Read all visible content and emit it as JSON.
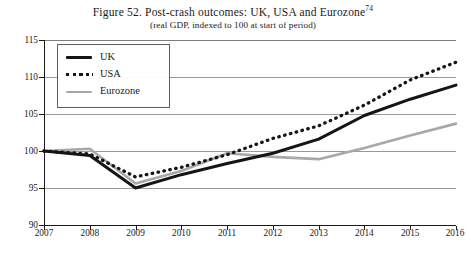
{
  "figure": {
    "title_main": "Figure 52. Post-crash outcomes: UK, USA and Eurozone",
    "title_footnote": "74",
    "subtitle": "(real GDP, indexed to 100 at start of period)"
  },
  "colors": {
    "uk": "#151515",
    "usa": "#151515",
    "eurozone": "#a8a8a8",
    "gridline": "#9a9a9a",
    "axis": "#1a1a1a",
    "background": "#ffffff"
  },
  "legend": {
    "position": "top-left-inside",
    "entries": [
      {
        "label": "UK",
        "style": "solid",
        "color": "#151515"
      },
      {
        "label": "USA",
        "style": "dotted",
        "color": "#151515"
      },
      {
        "label": "Eurozone",
        "style": "solid",
        "color": "#a8a8a8"
      }
    ]
  },
  "axes": {
    "y_ticks": [
      "115",
      "110",
      "105",
      "100",
      "95",
      "90"
    ],
    "x_ticks": [
      "2007",
      "2008",
      "2009",
      "2010",
      "2011",
      "2012",
      "2013",
      "2014",
      "2015",
      "2016"
    ]
  },
  "chart_data": {
    "type": "line",
    "title": "Figure 52. Post-crash outcomes: UK, USA and Eurozone",
    "subtitle": "(real GDP, indexed to 100 at start of period)",
    "xlabel": "",
    "ylabel": "",
    "x": [
      2007,
      2008,
      2009,
      2010,
      2011,
      2012,
      2013,
      2014,
      2015,
      2016
    ],
    "categories": [
      "2007",
      "2008",
      "2009",
      "2010",
      "2011",
      "2012",
      "2013",
      "2014",
      "2015",
      "2016"
    ],
    "xlim": [
      2007,
      2016
    ],
    "ylim": [
      90,
      115
    ],
    "y_tick_values": [
      90,
      95,
      100,
      105,
      110,
      115
    ],
    "grid": true,
    "legend_position": "upper left",
    "series": [
      {
        "name": "UK",
        "style": "solid",
        "color": "#151515",
        "values": [
          100.0,
          99.4,
          95.0,
          96.8,
          98.3,
          99.7,
          101.6,
          104.8,
          107.0,
          108.9
        ]
      },
      {
        "name": "USA",
        "style": "dotted",
        "color": "#151515",
        "values": [
          100.0,
          99.6,
          96.5,
          97.8,
          99.5,
          101.7,
          103.4,
          106.2,
          109.6,
          112.0
        ]
      },
      {
        "name": "Eurozone",
        "style": "solid",
        "color": "#a8a8a8",
        "values": [
          100.0,
          100.3,
          95.6,
          97.3,
          99.7,
          99.2,
          98.9,
          100.4,
          102.1,
          103.7
        ]
      }
    ]
  }
}
